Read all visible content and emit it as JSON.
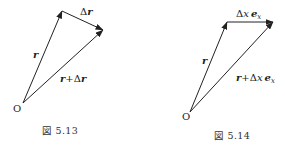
{
  "figures": [
    {
      "caption": "図 5.13",
      "origin_label": "O",
      "vector_r_label": "r",
      "delta_prefix": "Δ",
      "delta_label": "r",
      "sum_prefix": "r",
      "sum_plus": "+Δ",
      "sum_label": "r"
    },
    {
      "caption": "図 5.14",
      "origin_label": "O",
      "vector_r_label": "r",
      "delta_prefix": "Δ",
      "delta_var": "x",
      "delta_vec": "e",
      "delta_sub": "x",
      "sum_prefix": "r",
      "sum_plus": "+Δ",
      "sum_var": "x",
      "sum_vec": "e",
      "sum_sub": "x"
    }
  ],
  "colors": {
    "line": "#222222",
    "text": "#222222"
  }
}
